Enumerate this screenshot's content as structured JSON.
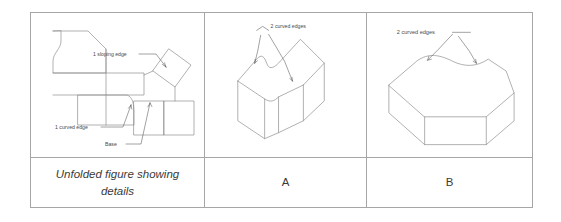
{
  "document": {
    "type": "geometry-figure-comparison-table",
    "columns": 3,
    "rows": 2
  },
  "panels": [
    {
      "id": "panel-unfolded",
      "caption": "Unfolded figure showing details",
      "caption_style": "italic",
      "annotations": [
        {
          "id": "sloping-edge",
          "text": "1 sloping edge"
        },
        {
          "id": "curved-edge",
          "text": "1 curved edge"
        },
        {
          "id": "base",
          "text": "Base"
        }
      ]
    },
    {
      "id": "panel-a",
      "caption": "A",
      "caption_style": "normal",
      "annotations": [
        {
          "id": "curved-edges-a",
          "text": "2 curved edges"
        }
      ]
    },
    {
      "id": "panel-b",
      "caption": "B",
      "caption_style": "normal",
      "annotations": [
        {
          "id": "curved-edges-b",
          "text": "2 curved edges"
        }
      ]
    }
  ],
  "colors": {
    "table_border": "#a6a6a6",
    "figure_stroke": "#8f8f8f",
    "leader_stroke": "#555555",
    "text": "#3a3a3a",
    "background": "#ffffff"
  }
}
